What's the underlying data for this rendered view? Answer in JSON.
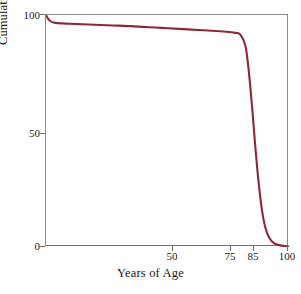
{
  "chart_data": {
    "type": "line",
    "title": "",
    "xlabel": "Years of Age",
    "ylabel": "Cumulative Survival (%)",
    "xlim": [
      0,
      100
    ],
    "ylim": [
      0,
      100
    ],
    "grid": false,
    "legend": null,
    "line_color": "#8B2A33",
    "axis_color": "#6f6f6f",
    "background": "#ffffff",
    "xticks": [
      50,
      75,
      85,
      100
    ],
    "xtick_labels": [
      "50",
      "75",
      "85",
      "100"
    ],
    "yticks": [
      0,
      50,
      100
    ],
    "ytick_labels": [
      "0",
      "50",
      "100"
    ],
    "series": [
      {
        "name": "Cumulative Survival",
        "x": [
          0,
          1,
          2,
          3,
          5,
          8,
          10,
          15,
          20,
          25,
          30,
          35,
          40,
          45,
          50,
          55,
          60,
          65,
          70,
          75,
          78,
          80,
          82,
          83,
          84,
          85,
          86,
          87,
          88,
          89,
          90,
          91,
          92,
          93,
          94,
          95,
          96,
          98,
          100
        ],
        "y": [
          100,
          98.2,
          97.2,
          96.8,
          96.5,
          96.3,
          96.2,
          96.0,
          95.8,
          95.6,
          95.4,
          95.2,
          94.9,
          94.6,
          94.3,
          94.0,
          93.7,
          93.4,
          93.1,
          92.7,
          92.3,
          91.5,
          87.0,
          80.0,
          70.0,
          58.0,
          45.0,
          33.0,
          23.0,
          15.0,
          9.5,
          6.0,
          3.8,
          2.4,
          1.6,
          1.1,
          0.8,
          0.4,
          0.2
        ]
      }
    ],
    "annotations": []
  },
  "axes": {
    "y_title": "Cumulative Survival (%)",
    "x_title": "Years of Age",
    "y_ticks": [
      {
        "label": "100",
        "value": 100
      },
      {
        "label": "50",
        "value": 50
      },
      {
        "label": "0",
        "value": 0
      }
    ],
    "x_ticks": [
      {
        "label": "50",
        "value": 50
      },
      {
        "label": "75",
        "value": 75
      },
      {
        "label": "85",
        "value": 85
      },
      {
        "label": "100",
        "value": 100
      }
    ]
  }
}
